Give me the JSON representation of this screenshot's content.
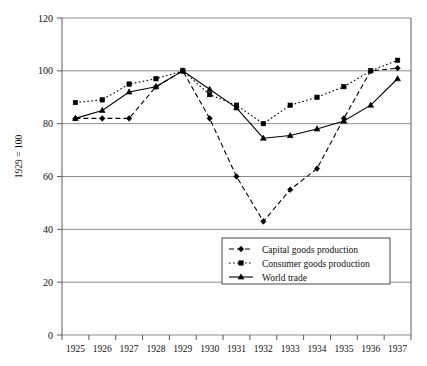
{
  "chart_data": {
    "type": "line",
    "title": "",
    "subtitle": "",
    "xlabel": "",
    "ylabel": "1929 = 100",
    "x": [
      1925,
      1926,
      1927,
      1928,
      1929,
      1930,
      1931,
      1932,
      1933,
      1934,
      1935,
      1936,
      1937
    ],
    "xtick_labels": [
      "1925",
      "1926",
      "1927",
      "1928",
      "1929",
      "1930",
      "1931",
      "1932",
      "1933",
      "1934",
      "1935",
      "1936",
      "1937"
    ],
    "ytick_labels": [
      "0",
      "20",
      "40",
      "60",
      "80",
      "100",
      "120"
    ],
    "yticks": [
      0,
      20,
      40,
      60,
      80,
      100,
      120
    ],
    "ylim": [
      0,
      120
    ],
    "grid": "horizontal",
    "legend_position": "inside-lower-center",
    "series": [
      {
        "name": "Capital goods production",
        "marker": "diamond",
        "linestyle": "dashed",
        "color": "#000000",
        "values": [
          82,
          82,
          82,
          94,
          100,
          82,
          60,
          43,
          55,
          63,
          82,
          100,
          101
        ]
      },
      {
        "name": "Consumer goods production",
        "marker": "square",
        "linestyle": "dotted",
        "color": "#000000",
        "values": [
          88,
          89,
          95,
          97,
          100,
          91,
          87,
          80,
          87,
          90,
          94,
          100,
          104
        ]
      },
      {
        "name": "World trade",
        "marker": "triangle",
        "linestyle": "solid",
        "color": "#000000",
        "values": [
          82,
          85,
          92,
          94,
          100,
          93,
          86,
          74.5,
          75.5,
          78,
          81,
          87,
          97
        ]
      }
    ]
  },
  "legend": {
    "entries": [
      {
        "label": "Capital goods production"
      },
      {
        "label": "Consumer goods production"
      },
      {
        "label": "World trade"
      }
    ]
  },
  "axes": {
    "y_axis_title": "1929 = 100"
  }
}
